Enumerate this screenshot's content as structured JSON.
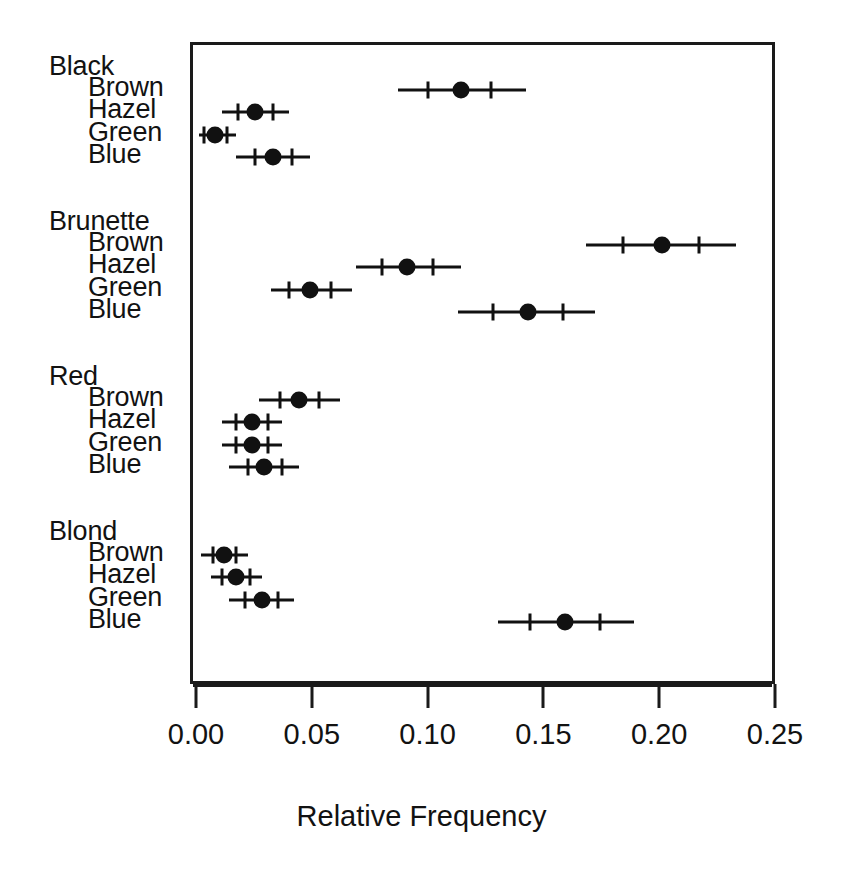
{
  "chart_data": {
    "type": "scatter",
    "title": "",
    "subtitle": "",
    "xlabel": "Relative Frequency",
    "ylabel": "",
    "xlim": [
      0.0,
      0.25
    ],
    "xticks": [
      "0.00",
      "0.05",
      "0.10",
      "0.15",
      "0.20",
      "0.25"
    ],
    "xtick_values": [
      0.0,
      0.05,
      0.1,
      0.15,
      0.2,
      0.25
    ],
    "grid": false,
    "legend": "none",
    "orientation": "horizontal",
    "marker": "filled-circle",
    "error_bars": "confidence-interval-with-inner-ticks",
    "color": "#111111",
    "groups": [
      {
        "label": "Black",
        "rows": [
          {
            "label": "Brown",
            "value": 0.113,
            "ci_low": 0.086,
            "ci_high": 0.141,
            "inner_low": 0.099,
            "inner_high": 0.126
          },
          {
            "label": "Hazel",
            "value": 0.024,
            "ci_low": 0.01,
            "ci_high": 0.039,
            "inner_low": 0.017,
            "inner_high": 0.032
          },
          {
            "label": "Green",
            "value": 0.007,
            "ci_low": 0.0,
            "ci_high": 0.016,
            "inner_low": 0.002,
            "inner_high": 0.012
          },
          {
            "label": "Blue",
            "value": 0.032,
            "ci_low": 0.016,
            "ci_high": 0.048,
            "inner_low": 0.024,
            "inner_high": 0.04
          }
        ]
      },
      {
        "label": "Brunette",
        "rows": [
          {
            "label": "Brown",
            "value": 0.2,
            "ci_low": 0.167,
            "ci_high": 0.232,
            "inner_low": 0.183,
            "inner_high": 0.216
          },
          {
            "label": "Hazel",
            "value": 0.09,
            "ci_low": 0.068,
            "ci_high": 0.113,
            "inner_low": 0.079,
            "inner_high": 0.101
          },
          {
            "label": "Green",
            "value": 0.048,
            "ci_low": 0.031,
            "ci_high": 0.066,
            "inner_low": 0.039,
            "inner_high": 0.057
          },
          {
            "label": "Blue",
            "value": 0.142,
            "ci_low": 0.112,
            "ci_high": 0.171,
            "inner_low": 0.127,
            "inner_high": 0.157
          }
        ]
      },
      {
        "label": "Red",
        "rows": [
          {
            "label": "Brown",
            "value": 0.043,
            "ci_low": 0.026,
            "ci_high": 0.061,
            "inner_low": 0.035,
            "inner_high": 0.052
          },
          {
            "label": "Hazel",
            "value": 0.023,
            "ci_low": 0.01,
            "ci_high": 0.036,
            "inner_low": 0.016,
            "inner_high": 0.03
          },
          {
            "label": "Green",
            "value": 0.023,
            "ci_low": 0.01,
            "ci_high": 0.036,
            "inner_low": 0.016,
            "inner_high": 0.03
          },
          {
            "label": "Blue",
            "value": 0.028,
            "ci_low": 0.013,
            "ci_high": 0.043,
            "inner_low": 0.021,
            "inner_high": 0.036
          }
        ]
      },
      {
        "label": "Blond",
        "rows": [
          {
            "label": "Brown",
            "value": 0.011,
            "ci_low": 0.001,
            "ci_high": 0.021,
            "inner_low": 0.006,
            "inner_high": 0.016
          },
          {
            "label": "Hazel",
            "value": 0.016,
            "ci_low": 0.005,
            "ci_high": 0.027,
            "inner_low": 0.01,
            "inner_high": 0.022
          },
          {
            "label": "Green",
            "value": 0.027,
            "ci_low": 0.013,
            "ci_high": 0.041,
            "inner_low": 0.02,
            "inner_high": 0.034
          },
          {
            "label": "Blue",
            "value": 0.158,
            "ci_low": 0.129,
            "ci_high": 0.188,
            "inner_low": 0.143,
            "inner_high": 0.173
          }
        ]
      }
    ]
  }
}
